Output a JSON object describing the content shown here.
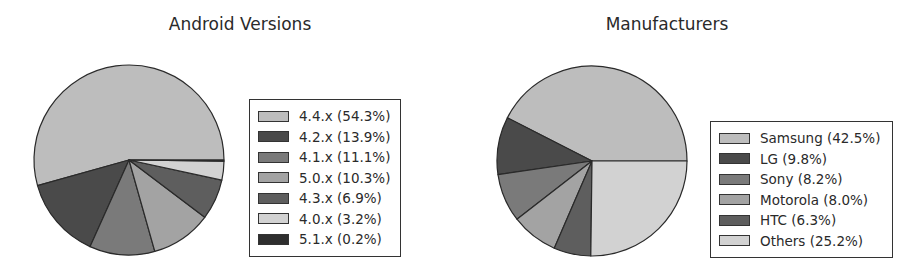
{
  "chart_data": [
    {
      "type": "pie",
      "title": "Android Versions",
      "start_angle_deg": 0,
      "direction": "counterclockwise",
      "legend_position": "right",
      "categories": [
        "4.4.x",
        "4.2.x",
        "4.1.x",
        "5.0.x",
        "4.3.x",
        "4.0.x",
        "5.1.x"
      ],
      "values": [
        54.3,
        13.9,
        11.1,
        10.3,
        6.9,
        3.2,
        0.2
      ],
      "legend_labels": [
        "4.4.x (54.3%)",
        "4.2.x (13.9%)",
        "4.1.x (11.1%)",
        "5.0.x (10.3%)",
        "4.3.x (6.9%)",
        "4.0.x (3.2%)",
        "5.1.x (0.2%)"
      ],
      "colors": [
        "#bdbdbd",
        "#4a4a4a",
        "#7a7a7a",
        "#a3a3a3",
        "#5e5e5e",
        "#d2d2d2",
        "#2e2e2e"
      ]
    },
    {
      "type": "pie",
      "title": "Manufacturers",
      "start_angle_deg": 0,
      "direction": "counterclockwise",
      "legend_position": "right",
      "categories": [
        "Samsung",
        "LG",
        "Sony",
        "Motorola",
        "HTC",
        "Others"
      ],
      "values": [
        42.5,
        9.8,
        8.2,
        8.0,
        6.3,
        25.2
      ],
      "legend_labels": [
        "Samsung (42.5%)",
        "LG (9.8%)",
        "Sony (8.2%)",
        "Motorola (8.0%)",
        "HTC (6.3%)",
        "Others (25.2%)"
      ],
      "colors": [
        "#bdbdbd",
        "#4a4a4a",
        "#7a7a7a",
        "#a3a3a3",
        "#5e5e5e",
        "#d2d2d2"
      ]
    }
  ]
}
